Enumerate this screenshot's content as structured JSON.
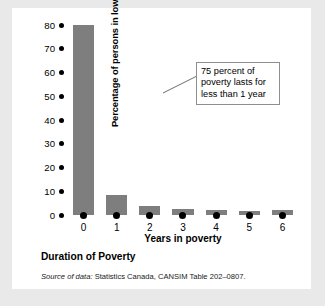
{
  "caption": "Duration of Poverty",
  "source": {
    "prefix": "Source of data:",
    "text": " Statistics Canada, CANSIM Table 202–0807."
  },
  "callout": {
    "line1": "75 percent of",
    "line2": "poverty lasts for",
    "line3": "less than 1 year"
  },
  "colors": {
    "bar": "#7e7e7e",
    "panel": "#ffffff",
    "frame": "#e9e9e9",
    "callout_border": "#8e8e8e",
    "axis_dot": "#000000"
  },
  "chart_data": {
    "type": "bar",
    "title": "Duration of Poverty",
    "xlabel": "Years in poverty",
    "ylabel": "Percentage of persons in low income",
    "categories": [
      "0",
      "1",
      "2",
      "3",
      "4",
      "5",
      "6"
    ],
    "values": [
      80,
      8.5,
      4,
      2.5,
      2,
      1.5,
      2
    ],
    "ylim": [
      0,
      80
    ],
    "yticks": [
      0,
      10,
      20,
      30,
      40,
      50,
      60,
      70,
      80
    ],
    "ytick_labels": [
      "0",
      "10",
      "20",
      "30",
      "40",
      "50",
      "60",
      "70",
      "80"
    ],
    "grid": false,
    "legend": "none",
    "annotations": [
      {
        "text": "75 percent of poverty lasts for less than 1 year",
        "target_category": "0"
      }
    ]
  }
}
